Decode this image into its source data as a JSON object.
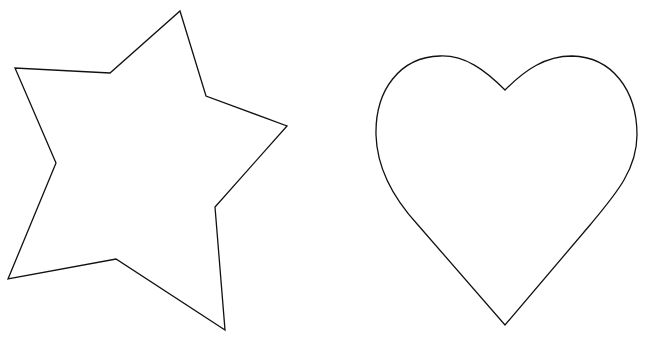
{
  "canvas": {
    "width": 647,
    "height": 337,
    "background": "#ffffff"
  },
  "shapes": [
    {
      "name": "star",
      "stroke": "#111111",
      "fill": "#ffffff",
      "stroke_width": 1.3,
      "points": "180,11 206,96 287,126 215,207 225,330 116,259 8,279 56,163 15,68 110,73"
    },
    {
      "name": "heart",
      "stroke": "#111111",
      "fill": "#ffffff",
      "stroke_width": 1.3,
      "path": "M505,90 C485,70 465,55 440,56 C400,57 375,90 376,135 C377,170 395,200 418,225 L505,325 L590,225 C615,195 637,170 637,135 C637,90 612,57 572,56 C545,56 525,70 505,90 Z"
    }
  ]
}
